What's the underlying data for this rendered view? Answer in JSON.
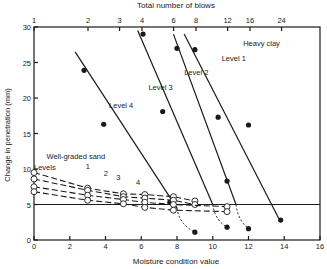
{
  "chart_data": {
    "type": "line",
    "title": "",
    "xlabel": "Moisture condition value",
    "ylabel": "Change in penetration (mm)",
    "x2label": "Total number of blows",
    "xlim": [
      0,
      16
    ],
    "ylim": [
      0,
      30
    ],
    "xticks": [
      0,
      2,
      4,
      6,
      8,
      10,
      12,
      14,
      16
    ],
    "yticks": [
      0,
      5,
      10,
      15,
      20,
      25,
      30
    ],
    "x2ticks": [
      1,
      2,
      3,
      4,
      6,
      8,
      12,
      16,
      24
    ],
    "grid": false,
    "reference_line": {
      "y": 5,
      "label": ""
    },
    "annotations": [
      {
        "text": "Heavy clay",
        "x": 11.7,
        "y": 27.3
      },
      {
        "text": "Level 1",
        "x": 10.5,
        "y": 25.2
      },
      {
        "text": "Level 2",
        "x": 8.4,
        "y": 23.2
      },
      {
        "text": "Level 3",
        "x": 6.4,
        "y": 21.1
      },
      {
        "text": "Level 4",
        "x": 4.2,
        "y": 18.6
      },
      {
        "text": "Well-graded sand",
        "x": 0.7,
        "y": 11.4
      },
      {
        "text": "Levels",
        "x": 0.0,
        "y": 9.9
      },
      {
        "text": "1",
        "x": 2.9,
        "y": 10.0
      },
      {
        "text": "2",
        "x": 3.9,
        "y": 9.0
      },
      {
        "text": "3",
        "x": 4.6,
        "y": 8.5
      },
      {
        "text": "4",
        "x": 5.7,
        "y": 7.7
      }
    ],
    "series": [
      {
        "name": "Heavy clay Level 1",
        "material": "Heavy clay",
        "style": "solid, filled markers",
        "x": [
          9.0,
          12.0,
          13.8
        ],
        "y": [
          26.8,
          16.2,
          2.8
        ],
        "line_x": [
          8.4,
          13.7
        ],
        "line_y": [
          29.0,
          3.0
        ]
      },
      {
        "name": "Heavy clay Level 2",
        "material": "Heavy clay",
        "style": "solid, filled markers",
        "x": [
          8.0,
          10.3,
          10.8,
          12.0
        ],
        "y": [
          27.0,
          17.3,
          8.3,
          1.6
        ],
        "line_x": [
          7.8,
          11.3
        ],
        "line_y": [
          29.0,
          5.0
        ]
      },
      {
        "name": "Heavy clay Level 3",
        "material": "Heavy clay",
        "style": "solid, filled markers",
        "x": [
          6.1,
          7.2,
          10.8
        ],
        "y": [
          29.0,
          18.1,
          1.8
        ],
        "line_x": [
          5.8,
          10.0
        ],
        "line_y": [
          29.5,
          5.0
        ]
      },
      {
        "name": "Heavy clay Level 4",
        "material": "Heavy clay",
        "style": "solid, filled markers",
        "x": [
          2.8,
          3.9,
          7.6,
          9.0
        ],
        "y": [
          23.9,
          16.3,
          5.3,
          1.1
        ],
        "line_x": [
          2.3,
          8.0
        ],
        "line_y": [
          26.5,
          4.5
        ]
      },
      {
        "name": "Well-graded sand Level 1",
        "material": "Well-graded sand",
        "style": "dashed, open markers",
        "x": [
          0.0,
          3.0,
          5.0,
          6.2,
          7.8,
          9.0
        ],
        "y": [
          9.5,
          7.3,
          6.5,
          6.4,
          6.1,
          5.5
        ]
      },
      {
        "name": "Well-graded sand Level 2",
        "material": "Well-graded sand",
        "style": "dashed, open markers",
        "x": [
          0.0,
          3.0,
          5.0,
          6.2,
          7.8,
          9.0
        ],
        "y": [
          8.6,
          7.0,
          6.1,
          5.9,
          5.6,
          5.0
        ]
      },
      {
        "name": "Well-graded sand Level 3",
        "material": "Well-graded sand",
        "style": "dashed, open markers",
        "x": [
          0.0,
          3.0,
          5.0,
          6.2,
          7.8,
          10.8
        ],
        "y": [
          7.5,
          6.3,
          5.7,
          5.3,
          5.0,
          4.7
        ]
      },
      {
        "name": "Well-graded sand Level 4",
        "material": "Well-graded sand",
        "style": "dashed, open markers",
        "x": [
          0.0,
          3.0,
          5.0,
          6.2,
          7.8,
          10.8
        ],
        "y": [
          6.8,
          5.6,
          5.1,
          4.6,
          4.2,
          4.0
        ]
      }
    ]
  }
}
